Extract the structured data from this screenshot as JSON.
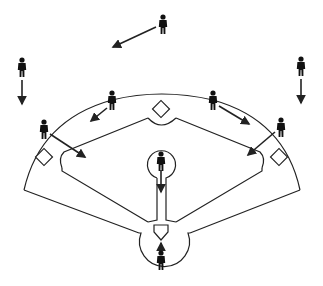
{
  "diagram": {
    "colors": {
      "line": "#222222",
      "player": "#111111",
      "background": "#ffffff"
    },
    "players": [
      {
        "id": "center-fielder",
        "x": 163,
        "y": 27,
        "arrow_to": [
          113,
          47
        ]
      },
      {
        "id": "left-fielder",
        "x": 22,
        "y": 70,
        "arrow_to": [
          22,
          104
        ]
      },
      {
        "id": "right-fielder",
        "x": 301,
        "y": 69,
        "arrow_to": [
          301,
          103
        ]
      },
      {
        "id": "shortstop",
        "x": 112,
        "y": 103,
        "arrow_to": [
          91,
          121
        ]
      },
      {
        "id": "second-baseman",
        "x": 213,
        "y": 103,
        "arrow_to": [
          249,
          124
        ]
      },
      {
        "id": "third-baseman",
        "x": 44,
        "y": 130,
        "arrow_to": [
          85,
          157
        ]
      },
      {
        "id": "first-baseman",
        "x": 281,
        "y": 128,
        "arrow_to": [
          248,
          155
        ]
      },
      {
        "id": "pitcher",
        "x": 161,
        "y": 162,
        "arrow_to": [
          161,
          192
        ]
      },
      {
        "id": "catcher",
        "x": 161,
        "y": 262,
        "arrow_to": [
          161,
          244
        ]
      }
    ],
    "bases": [
      "home-plate",
      "first-base",
      "second-base",
      "third-base",
      "pitchers-mound"
    ]
  }
}
